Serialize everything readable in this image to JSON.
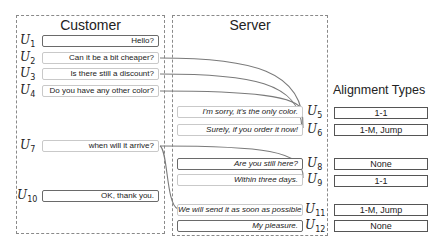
{
  "customer": {
    "title": "Customer",
    "utterances": [
      {
        "id": "U",
        "sub": "1",
        "text": "Hello?"
      },
      {
        "id": "U",
        "sub": "2",
        "text": "Can it be a bit cheaper?"
      },
      {
        "id": "U",
        "sub": "3",
        "text": "Is there still a discount?"
      },
      {
        "id": "U",
        "sub": "4",
        "text": "Do you have any other color?"
      },
      {
        "id": "U",
        "sub": "7",
        "text": "when will it arrive?"
      },
      {
        "id": "U",
        "sub": "10",
        "text": "OK, thank you."
      }
    ]
  },
  "server": {
    "title": "Server",
    "utterances": [
      {
        "id": "U",
        "sub": "5",
        "text": "I'm sorry, it's the only color."
      },
      {
        "id": "U",
        "sub": "6",
        "text": "Surely, if you order it now!"
      },
      {
        "id": "U",
        "sub": "8",
        "text": "Are you still here?"
      },
      {
        "id": "U",
        "sub": "9",
        "text": "Within three days."
      },
      {
        "id": "U",
        "sub": "11",
        "text": "We will send it as soon as possible"
      },
      {
        "id": "U",
        "sub": "12",
        "text": "My pleasure."
      }
    ]
  },
  "alignment": {
    "title": "Alignment Types",
    "types": [
      "1-1",
      "1-M, Jump",
      "None",
      "1-1",
      "1-M, Jump",
      "None"
    ]
  },
  "links": [
    {
      "from": "U2",
      "to": "U6"
    },
    {
      "from": "U3",
      "to": "U6"
    },
    {
      "from": "U4",
      "to": "U5"
    },
    {
      "from": "U7",
      "to": "U9"
    },
    {
      "from": "U7",
      "to": "U11"
    }
  ],
  "colors": {
    "link": "#7a7a7a",
    "panel_border": "#8a8a8a"
  }
}
